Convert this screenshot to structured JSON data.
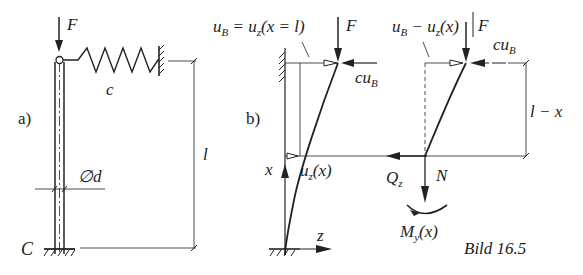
{
  "figure": {
    "caption": "Bild 16.5",
    "colors": {
      "ink": "#222222",
      "background": "#ffffff"
    }
  },
  "part_a": {
    "label": "a)",
    "force_label": "F",
    "spring_label": "c",
    "diameter_label": "∅d",
    "length_label": "l",
    "base_label": "C"
  },
  "part_b": {
    "label": "b)",
    "top_left_annotation": "u_B = u_z(x = l)",
    "top_left_parts": {
      "a": "u",
      "a_sub": "B",
      "b": " = u",
      "b_sub": "z",
      "c": "(x = l)"
    },
    "force_label_left": "F",
    "spring_force_left": {
      "main": "cu",
      "sub": "B"
    },
    "top_right_parts": {
      "a": "u",
      "a_sub": "B",
      "b": " − u",
      "b_sub": "z",
      "c": "(x)"
    },
    "force_label_right": "F",
    "spring_force_right": {
      "main": "cu",
      "sub": "B"
    },
    "segment_length_label": "l − x",
    "x_axis_label": "x",
    "z_axis_label": "z",
    "deflection_label": {
      "main": "u",
      "sub": "z",
      "rest": "(x)"
    },
    "shear_label": {
      "main": "Q",
      "sub": "z"
    },
    "normal_label": "N",
    "moment_label": {
      "main": "M",
      "sub": "y",
      "rest": "(x)"
    }
  }
}
